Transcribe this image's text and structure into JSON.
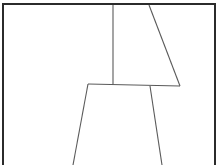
{
  "canvas": {
    "width": 224,
    "height": 165,
    "background_color": "#ffffff",
    "title": "Line Drawing Panel"
  },
  "frame": {
    "name": "panel-border",
    "color": "#2b2b2b",
    "stroke_width": 2,
    "left": 3,
    "top": 4,
    "right": 215,
    "bottom": 165,
    "open_side": "bottom"
  },
  "figure": {
    "name": "chair-line-drawing",
    "color": "#5a5a5a",
    "stroke_width": 1.1,
    "strokes": [
      {
        "name": "backrest-vertical-line",
        "points": "113,5 113,84"
      },
      {
        "name": "backrest-diagonal-line",
        "points": "149,5 180,86"
      },
      {
        "name": "seat-horizontal-line",
        "points": "88,84 180,86"
      },
      {
        "name": "front-left-leg-line",
        "points": "88,84 73,165"
      },
      {
        "name": "front-right-leg-line",
        "points": "150,86 162,165"
      }
    ]
  }
}
